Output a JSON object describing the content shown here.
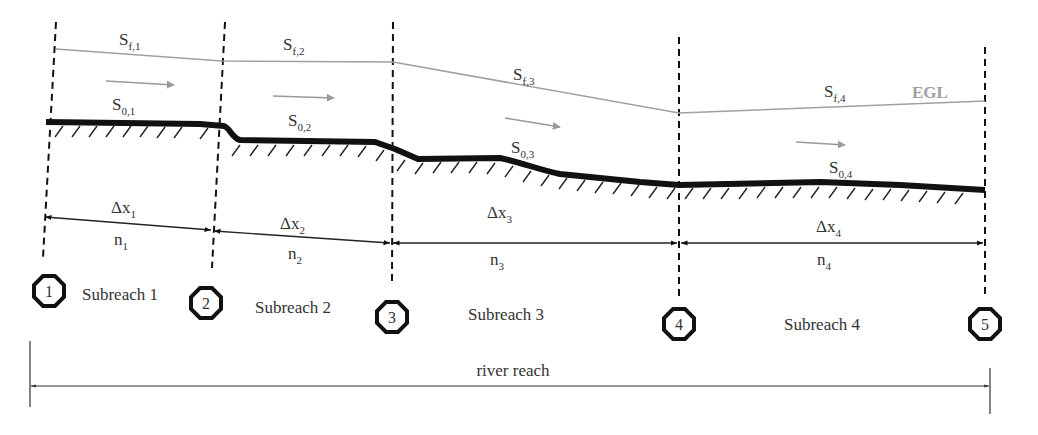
{
  "colors": {
    "bed": "#111111",
    "egl": "#a0a0a0",
    "flow_arrow": "#9a9a9a",
    "text": "#333333",
    "dashed": "#111111"
  },
  "egl_label": "EGL",
  "river_reach_label": "river reach",
  "sections": [
    {
      "id": "1",
      "x": 48
    },
    {
      "id": "2",
      "x": 213
    },
    {
      "id": "3",
      "x": 391
    },
    {
      "id": "4",
      "x": 679
    },
    {
      "id": "5",
      "x": 985
    }
  ],
  "subreaches": [
    {
      "label": "Subreach 1",
      "friction_slope": {
        "base": "S",
        "sub": "f,1"
      },
      "bed_slope": {
        "base": "S",
        "sub": "0,1"
      },
      "length": {
        "base": "Δx",
        "sub": "1"
      },
      "roughness": {
        "base": "n",
        "sub": "1"
      }
    },
    {
      "label": "Subreach 2",
      "friction_slope": {
        "base": "S",
        "sub": "f,2"
      },
      "bed_slope": {
        "base": "S",
        "sub": "0,2"
      },
      "length": {
        "base": "Δx",
        "sub": "2"
      },
      "roughness": {
        "base": "n",
        "sub": "2"
      }
    },
    {
      "label": "Subreach 3",
      "friction_slope": {
        "base": "S",
        "sub": "f,3"
      },
      "bed_slope": {
        "base": "S",
        "sub": "0,3"
      },
      "length": {
        "base": "Δx",
        "sub": "3"
      },
      "roughness": {
        "base": "n",
        "sub": "3"
      }
    },
    {
      "label": "Subreach 4",
      "friction_slope": {
        "base": "S",
        "sub": "f,4"
      },
      "bed_slope": {
        "base": "S",
        "sub": "0,4"
      },
      "length": {
        "base": "Δx",
        "sub": "4"
      },
      "roughness": {
        "base": "n",
        "sub": "4"
      }
    }
  ]
}
